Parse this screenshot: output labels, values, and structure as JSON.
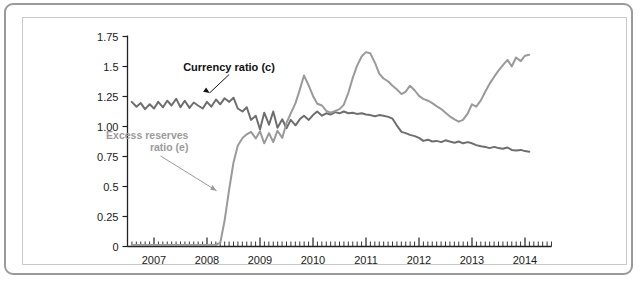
{
  "chart_data": {
    "type": "line",
    "title": "",
    "xlabel": "",
    "ylabel": "",
    "xlim": [
      2006.5,
      2014.5
    ],
    "ylim": [
      0,
      1.75
    ],
    "grid": false,
    "legend_position": "inline-annotations",
    "y_ticks": [
      "0",
      "0.25",
      "0.5",
      "0.75",
      "1.00",
      "1.25",
      "1.5",
      "1.75"
    ],
    "y_tick_values": [
      0,
      0.25,
      0.5,
      0.75,
      1.0,
      1.25,
      1.5,
      1.75
    ],
    "x_ticks": [
      "2007",
      "2008",
      "2009",
      "2010",
      "2011",
      "2012",
      "2013",
      "2014"
    ],
    "x_tick_values": [
      2007,
      2008,
      2009,
      2010,
      2011,
      2012,
      2013,
      2014
    ],
    "minor_tick_interval_months": 1,
    "annotations": [
      {
        "name": "currency-ratio-label",
        "text": "Currency ratio (c)",
        "color": "#111111",
        "x": 2007.55,
        "y": 1.5,
        "arrow_to_x": 2008.05,
        "arrow_to_y": 1.255
      },
      {
        "name": "excess-reserves-label",
        "line1": "Excess reserves",
        "line2": "ratio (e)",
        "color": "#9b9b9b",
        "x": 2007.65,
        "y": 0.93,
        "arrow_to_x": 2008.18,
        "arrow_to_y": 0.44
      }
    ],
    "series": [
      {
        "name": "Currency ratio (c)",
        "key": "c",
        "color": "#6e6e6e",
        "line_width": 2.0,
        "x": [
          2006.58,
          2006.67,
          2006.75,
          2006.83,
          2006.92,
          2007.0,
          2007.08,
          2007.17,
          2007.25,
          2007.33,
          2007.42,
          2007.5,
          2007.58,
          2007.67,
          2007.75,
          2007.83,
          2007.92,
          2008.0,
          2008.08,
          2008.17,
          2008.25,
          2008.33,
          2008.42,
          2008.5,
          2008.58,
          2008.67,
          2008.75,
          2008.83,
          2008.92,
          2009.0,
          2009.08,
          2009.17,
          2009.25,
          2009.33,
          2009.42,
          2009.5,
          2009.58,
          2009.67,
          2009.75,
          2009.83,
          2009.92,
          2010.0,
          2010.08,
          2010.17,
          2010.25,
          2010.33,
          2010.42,
          2010.5,
          2010.58,
          2010.67,
          2010.75,
          2010.83,
          2010.92,
          2011.0,
          2011.08,
          2011.17,
          2011.25,
          2011.33,
          2011.42,
          2011.5,
          2011.58,
          2011.67,
          2011.75,
          2011.83,
          2011.92,
          2012.0,
          2012.08,
          2012.17,
          2012.25,
          2012.33,
          2012.42,
          2012.5,
          2012.58,
          2012.67,
          2012.75,
          2012.83,
          2012.92,
          2013.0,
          2013.08,
          2013.17,
          2013.25,
          2013.33,
          2013.42,
          2013.5,
          2013.58,
          2013.67,
          2013.75,
          2013.83,
          2013.92,
          2014.0,
          2014.08
        ],
        "values": [
          1.205,
          1.165,
          1.195,
          1.145,
          1.185,
          1.15,
          1.205,
          1.16,
          1.215,
          1.175,
          1.23,
          1.16,
          1.215,
          1.155,
          1.2,
          1.175,
          1.15,
          1.205,
          1.165,
          1.225,
          1.185,
          1.235,
          1.205,
          1.24,
          1.15,
          1.125,
          1.16,
          1.055,
          1.09,
          0.975,
          1.115,
          1.015,
          1.125,
          0.99,
          1.06,
          0.985,
          1.055,
          1.01,
          1.06,
          1.09,
          1.055,
          1.095,
          1.125,
          1.09,
          1.11,
          1.1,
          1.12,
          1.11,
          1.125,
          1.11,
          1.115,
          1.105,
          1.11,
          1.1,
          1.095,
          1.085,
          1.095,
          1.09,
          1.08,
          1.065,
          1.01,
          0.955,
          0.945,
          0.93,
          0.92,
          0.905,
          0.88,
          0.89,
          0.875,
          0.88,
          0.87,
          0.885,
          0.875,
          0.865,
          0.875,
          0.86,
          0.87,
          0.86,
          0.845,
          0.835,
          0.83,
          0.82,
          0.83,
          0.82,
          0.815,
          0.825,
          0.805,
          0.8,
          0.805,
          0.795,
          0.79
        ]
      },
      {
        "name": "Excess reserves ratio (e)",
        "key": "e",
        "color": "#9a9a9a",
        "line_width": 2.0,
        "x": [
          2006.58,
          2006.75,
          2006.92,
          2007.0,
          2007.17,
          2007.33,
          2007.5,
          2007.67,
          2007.83,
          2008.0,
          2008.08,
          2008.17,
          2008.25,
          2008.33,
          2008.42,
          2008.5,
          2008.58,
          2008.67,
          2008.75,
          2008.83,
          2008.92,
          2009.0,
          2009.08,
          2009.17,
          2009.25,
          2009.33,
          2009.42,
          2009.5,
          2009.58,
          2009.67,
          2009.75,
          2009.83,
          2009.92,
          2010.0,
          2010.08,
          2010.17,
          2010.25,
          2010.33,
          2010.42,
          2010.5,
          2010.58,
          2010.67,
          2010.75,
          2010.83,
          2010.92,
          2011.0,
          2011.08,
          2011.17,
          2011.25,
          2011.33,
          2011.42,
          2011.5,
          2011.58,
          2011.67,
          2011.75,
          2011.83,
          2011.92,
          2012.0,
          2012.08,
          2012.17,
          2012.25,
          2012.33,
          2012.42,
          2012.5,
          2012.58,
          2012.67,
          2012.75,
          2012.83,
          2012.92,
          2013.0,
          2013.08,
          2013.17,
          2013.25,
          2013.33,
          2013.42,
          2013.5,
          2013.58,
          2013.67,
          2013.75,
          2013.83,
          2013.92,
          2014.0,
          2014.08
        ],
        "values": [
          0.012,
          0.012,
          0.012,
          0.012,
          0.012,
          0.012,
          0.012,
          0.012,
          0.012,
          0.012,
          0.012,
          0.015,
          0.03,
          0.21,
          0.48,
          0.7,
          0.84,
          0.905,
          0.935,
          0.955,
          0.9,
          0.96,
          0.86,
          0.945,
          0.87,
          0.965,
          0.905,
          1.03,
          1.11,
          1.195,
          1.305,
          1.425,
          1.34,
          1.255,
          1.19,
          1.175,
          1.13,
          1.115,
          1.13,
          1.145,
          1.18,
          1.285,
          1.405,
          1.505,
          1.585,
          1.62,
          1.61,
          1.53,
          1.44,
          1.4,
          1.375,
          1.34,
          1.31,
          1.27,
          1.29,
          1.34,
          1.3,
          1.255,
          1.23,
          1.215,
          1.195,
          1.17,
          1.145,
          1.115,
          1.085,
          1.06,
          1.04,
          1.055,
          1.11,
          1.185,
          1.165,
          1.22,
          1.29,
          1.355,
          1.415,
          1.465,
          1.51,
          1.555,
          1.5,
          1.575,
          1.545,
          1.59,
          1.598
        ]
      }
    ]
  }
}
